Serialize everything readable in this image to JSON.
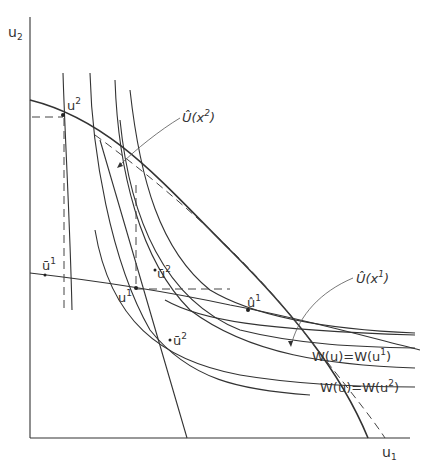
{
  "axes": {
    "y_label": "u",
    "y_sub": "2",
    "x_label": "u",
    "x_sub": "1"
  },
  "labels": {
    "u2_point": {
      "base": "u",
      "sup": "2"
    },
    "u1_point": {
      "base": "u",
      "sup": "1"
    },
    "ubar1": {
      "base": "ū",
      "sup": "1"
    },
    "ubar2_upper": {
      "base": "ū",
      "sup": "2"
    },
    "ubar2_lower": {
      "base": "ū",
      "sup": "2"
    },
    "uhat1": {
      "base": "û",
      "sup": "1"
    },
    "frontier_x2": {
      "base": "Û(x",
      "sup": "2",
      "tail": ")"
    },
    "frontier_x1": {
      "base": "Û(x",
      "sup": "1",
      "tail": ")"
    },
    "welfare_u1": {
      "text": "W(u)=W(u",
      "sup": "1",
      "tail": ")"
    },
    "welfare_u2": {
      "text": "W(u)=W(u",
      "sup": "2",
      "tail": ")"
    }
  },
  "colors": {
    "ink": "#333333",
    "background": "#ffffff"
  }
}
